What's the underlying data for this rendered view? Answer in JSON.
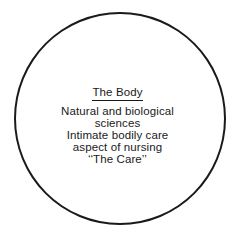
{
  "diagram": {
    "shape": "circle",
    "stroke_color": "#1a1a1a",
    "heading": "The Body",
    "lines": [
      "Natural and biological",
      "sciences",
      "Intimate bodily care",
      "aspect of nursing",
      "‘‘The Care’’"
    ]
  }
}
